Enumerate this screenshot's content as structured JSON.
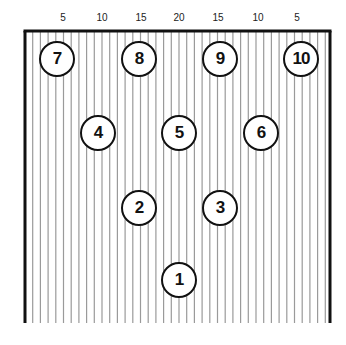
{
  "board": {
    "left": 25,
    "right": 330,
    "top": 31,
    "bottom": 323,
    "line_spacing": 7.7,
    "line_color": "#9a9a9a",
    "border_color": "#111111"
  },
  "scale_labels": [
    {
      "text": "5",
      "x": 63
    },
    {
      "text": "10",
      "x": 102
    },
    {
      "text": "15",
      "x": 141
    },
    {
      "text": "20",
      "x": 179
    },
    {
      "text": "15",
      "x": 218
    },
    {
      "text": "10",
      "x": 258
    },
    {
      "text": "5",
      "x": 297
    }
  ],
  "pins": [
    {
      "label": "1",
      "x": 179,
      "y": 280
    },
    {
      "label": "2",
      "x": 139,
      "y": 208
    },
    {
      "label": "3",
      "x": 220,
      "y": 208
    },
    {
      "label": "4",
      "x": 98,
      "y": 133
    },
    {
      "label": "5",
      "x": 179,
      "y": 133
    },
    {
      "label": "6",
      "x": 261,
      "y": 133
    },
    {
      "label": "7",
      "x": 57,
      "y": 59
    },
    {
      "label": "8",
      "x": 139,
      "y": 59
    },
    {
      "label": "9",
      "x": 220,
      "y": 59
    },
    {
      "label": "10",
      "x": 301,
      "y": 59
    }
  ]
}
